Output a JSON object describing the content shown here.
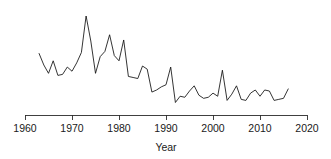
{
  "chart_data": {
    "type": "line",
    "title": "",
    "subtitle": "",
    "xlabel": "Year",
    "ylabel": "",
    "grid": false,
    "legend": "none",
    "xlim": [
      1960,
      2020
    ],
    "ylim": [
      0,
      100
    ],
    "xticks": [
      1960,
      1970,
      1980,
      1990,
      2000,
      2010,
      2020
    ],
    "xtick_labels": [
      "1960",
      "1970",
      "1980",
      "1990",
      "2000",
      "2010",
      "2020"
    ],
    "yticks": [],
    "ytick_labels": [],
    "annotations": [],
    "series": [
      {
        "name": "count",
        "color": "#111111",
        "x": [
          1963,
          1964,
          1965,
          1966,
          1967,
          1968,
          1969,
          1970,
          1971,
          1972,
          1973,
          1974,
          1975,
          1976,
          1977,
          1978,
          1979,
          1980,
          1981,
          1982,
          1983,
          1984,
          1985,
          1986,
          1987,
          1988,
          1989,
          1990,
          1991,
          1992,
          1993,
          1994,
          1995,
          1996,
          1997,
          1998,
          1999,
          2000,
          2001,
          2002,
          2003,
          2004,
          2005,
          2006,
          2007,
          2008,
          2009,
          2010,
          2011,
          2012,
          2013,
          2014,
          2015,
          2016
        ],
        "values": [
          59,
          48,
          40,
          52,
          38,
          39,
          46,
          42,
          50,
          60,
          95,
          71,
          40,
          56,
          61,
          77,
          57,
          52,
          72,
          37,
          36,
          35,
          47,
          44,
          22,
          24,
          27,
          29,
          46,
          12,
          18,
          17,
          23,
          28,
          19,
          16,
          17,
          21,
          18,
          43,
          14,
          20,
          28,
          15,
          14,
          21,
          24,
          18,
          24,
          23,
          14,
          15,
          16,
          25
        ]
      }
    ]
  },
  "axis": {
    "x_axis_name": "x-axis",
    "x_title": "Year"
  }
}
